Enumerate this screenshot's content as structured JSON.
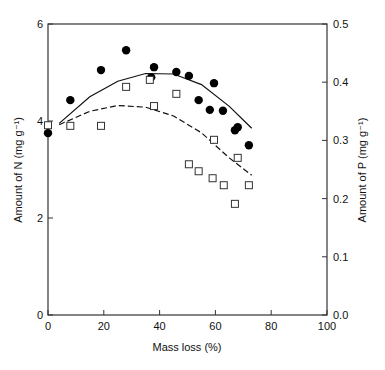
{
  "chart_data": {
    "type": "scatter",
    "title": "",
    "xlabel": "Mass loss (%)",
    "ylabel": "Amount of N (mg g⁻¹)",
    "ylabel_right": "Amount of P (mg g⁻¹)",
    "xlim": [
      0,
      100
    ],
    "ylim": [
      0,
      6
    ],
    "ylim_right": [
      0,
      0.5
    ],
    "x_ticks": [
      "0",
      "20",
      "40",
      "60",
      "80",
      "100"
    ],
    "y_ticks": [
      "0",
      "2",
      "4",
      "6"
    ],
    "y_ticks_right": [
      "0.0",
      "0.1",
      "0.2",
      "0.3",
      "0.4",
      "0.5"
    ],
    "grid": false,
    "legend": null,
    "series": [
      {
        "name": "N",
        "axis": "left",
        "marker": "filled-circle",
        "points": [
          [
            0,
            3.75
          ],
          [
            8,
            4.43
          ],
          [
            19,
            5.05
          ],
          [
            28,
            5.46
          ],
          [
            37,
            4.9
          ],
          [
            38,
            5.11
          ],
          [
            46,
            5.01
          ],
          [
            50.5,
            4.93
          ],
          [
            54,
            4.43
          ],
          [
            58,
            4.23
          ],
          [
            59.5,
            4.78
          ],
          [
            62.7,
            4.21
          ],
          [
            67,
            3.81
          ],
          [
            68,
            3.87
          ],
          [
            72,
            3.5
          ]
        ],
        "fit": {
          "style": "solid",
          "points": [
            [
              4,
              3.95
            ],
            [
              15,
              4.5
            ],
            [
              25,
              4.82
            ],
            [
              35,
              4.98
            ],
            [
              45,
              4.97
            ],
            [
              55,
              4.75
            ],
            [
              65,
              4.3
            ],
            [
              73,
              3.85
            ]
          ]
        }
      },
      {
        "name": "P",
        "axis": "right",
        "marker": "open-square",
        "points": [
          [
            0,
            0.326
          ],
          [
            8,
            0.325
          ],
          [
            19,
            0.325
          ],
          [
            28,
            0.392
          ],
          [
            36.5,
            0.404
          ],
          [
            38,
            0.359
          ],
          [
            46,
            0.38
          ],
          [
            50.5,
            0.259
          ],
          [
            54,
            0.247
          ],
          [
            59,
            0.235
          ],
          [
            59.5,
            0.301
          ],
          [
            63,
            0.223
          ],
          [
            67,
            0.191
          ],
          [
            68,
            0.27
          ],
          [
            72,
            0.223
          ]
        ],
        "fit": {
          "style": "dashed",
          "points": [
            [
              4,
              0.327
            ],
            [
              15,
              0.35
            ],
            [
              25,
              0.36
            ],
            [
              35,
              0.357
            ],
            [
              45,
              0.342
            ],
            [
              55,
              0.313
            ],
            [
              65,
              0.27
            ],
            [
              73,
              0.24
            ]
          ]
        }
      }
    ],
    "annotations": []
  }
}
